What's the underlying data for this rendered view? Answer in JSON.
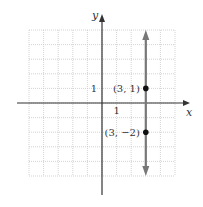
{
  "chart_data": {
    "type": "line",
    "title": "",
    "xlabel": "x",
    "ylabel": "y",
    "xlim": [
      -5,
      5
    ],
    "ylim": [
      -5,
      5
    ],
    "grid": true,
    "tick_labels": {
      "x": [
        {
          "value": 1,
          "label": "1"
        }
      ],
      "y": [
        {
          "value": 1,
          "label": "1"
        }
      ]
    },
    "series": [
      {
        "name": "x = 3",
        "kind": "vertical-line",
        "x": 3,
        "y_range": [
          -5,
          5
        ],
        "arrows": "both",
        "color": "#777777"
      }
    ],
    "points": [
      {
        "x": 3,
        "y": 1,
        "label": "(3, 1)"
      },
      {
        "x": 3,
        "y": -2,
        "label": "(3, −2)"
      }
    ],
    "colors": {
      "axis": "#333333",
      "grid": "#c8c8c8",
      "line": "#777777",
      "point": "#111111"
    }
  }
}
